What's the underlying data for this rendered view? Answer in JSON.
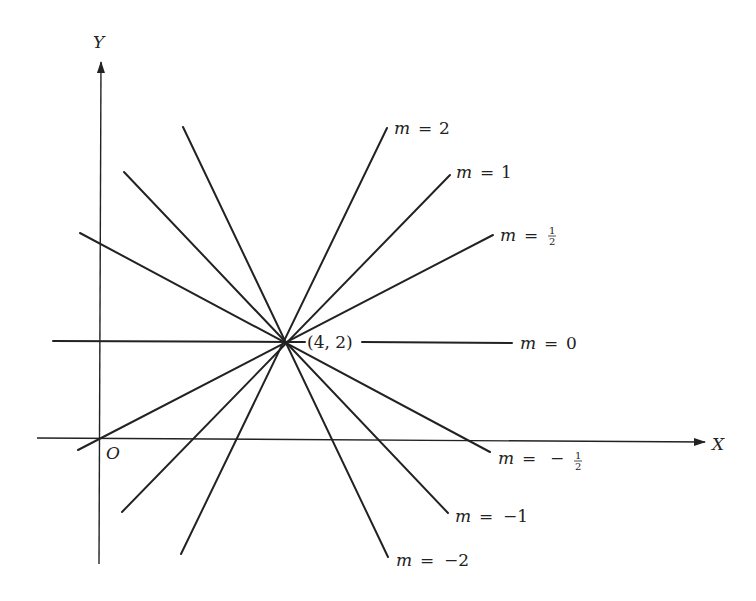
{
  "figure": {
    "axes": {
      "x_label": "X",
      "y_label": "Y",
      "origin_label": "O"
    },
    "point_label": "(4, 2)",
    "line_color": "#222222",
    "lines": [
      {
        "slope": "2",
        "label_m": "m",
        "label_eq": "=",
        "label_value": "2"
      },
      {
        "slope": "1",
        "label_m": "m",
        "label_eq": "=",
        "label_value": "1"
      },
      {
        "slope": "1/2",
        "label_m": "m",
        "label_eq": "=",
        "label_num": "1",
        "label_den": "2"
      },
      {
        "slope": "0",
        "label_m": "m",
        "label_eq": "=",
        "label_value": "0"
      },
      {
        "slope": "-1/2",
        "label_m": "m",
        "label_eq": "=",
        "label_sign": "−",
        "label_num": "1",
        "label_den": "2"
      },
      {
        "slope": "-1",
        "label_m": "m",
        "label_eq": "=",
        "label_value": "−1"
      },
      {
        "slope": "-2",
        "label_m": "m",
        "label_eq": "=",
        "label_value": "−2"
      }
    ]
  }
}
